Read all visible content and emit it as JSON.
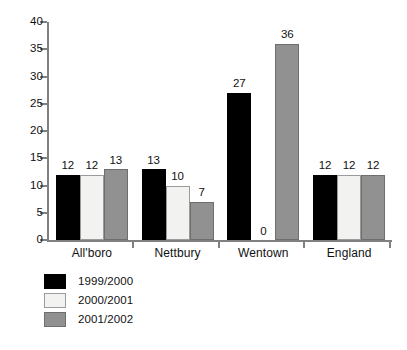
{
  "chart_data": {
    "type": "bar",
    "title": "",
    "subtitle": "",
    "xlabel": "",
    "ylabel": "",
    "ylim": [
      0,
      40
    ],
    "yticks": [
      0,
      5,
      10,
      15,
      20,
      25,
      30,
      35,
      40
    ],
    "grid": false,
    "legend_position": "below-left",
    "categories": [
      "All'boro",
      "Nettbury",
      "Wentown",
      "England"
    ],
    "series": [
      {
        "name": "1999/2000",
        "color": "#000000",
        "values": [
          12,
          13,
          27,
          12
        ]
      },
      {
        "name": "2000/2001",
        "color": "#f2f2f0",
        "values": [
          12,
          10,
          0,
          12
        ]
      },
      {
        "name": "2001/2002",
        "color": "#919191",
        "values": [
          13,
          7,
          36,
          12
        ]
      }
    ],
    "value_labels": [
      [
        "12",
        "12",
        "13"
      ],
      [
        "13",
        "10",
        "7"
      ],
      [
        "27",
        "0",
        "36"
      ],
      [
        "12",
        "12",
        "12"
      ]
    ]
  },
  "legend": {
    "items": [
      {
        "label": "1999/2000"
      },
      {
        "label": "2000/2001"
      },
      {
        "label": "2001/2002"
      }
    ]
  }
}
